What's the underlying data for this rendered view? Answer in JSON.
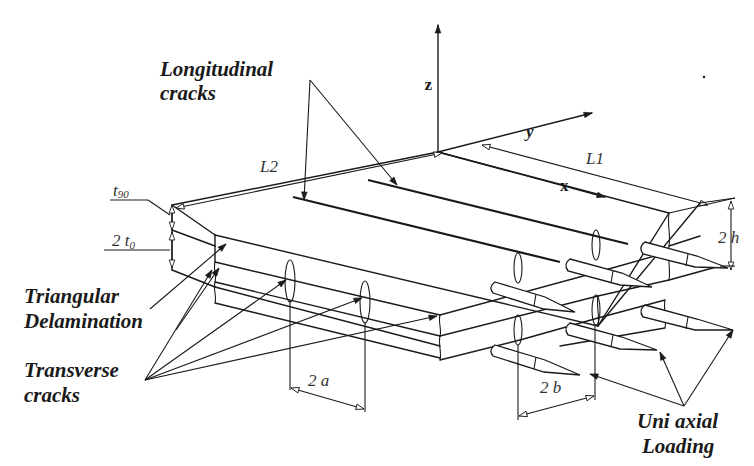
{
  "figure": {
    "axes": {
      "x": "x",
      "y": "y",
      "z": "z"
    },
    "dimensions": {
      "L1": "L1",
      "L2": "L2",
      "two_h": "2 h",
      "two_a": "2 a",
      "two_b": "2 b",
      "t90": {
        "base": "t",
        "sub": "90"
      },
      "two_t0": {
        "base": "2 t",
        "sub": "0"
      }
    },
    "labels": {
      "longitudinal_cracks": [
        "Longitudinal",
        "cracks"
      ],
      "triangular_delamination": [
        "Triangular",
        "Delamination"
      ],
      "transverse_cracks": [
        "Transverse",
        "cracks"
      ],
      "uniaxial_loading": [
        "Uni axial",
        "Loading"
      ]
    },
    "colors": {
      "ink": "#1a1a1a",
      "background": "#ffffff"
    }
  }
}
